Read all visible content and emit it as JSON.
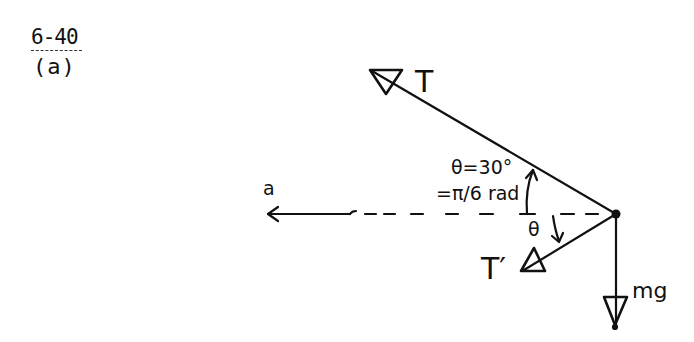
{
  "problem": {
    "number": "6-40",
    "part": "(a)"
  },
  "diagram": {
    "type": "free-body diagram",
    "body_point": {
      "x": 616,
      "y": 214
    },
    "forces": [
      {
        "label": "T",
        "direction": "up-left",
        "angle_from_horizontal": "30°"
      },
      {
        "label": "T′",
        "direction": "down-left",
        "angle_from_horizontal": "θ"
      },
      {
        "label": "mg",
        "direction": "down"
      }
    ],
    "acceleration": {
      "label": "a",
      "direction": "left"
    },
    "angle_annotation": {
      "line1": "θ=30°",
      "line2": "=π/6 rad"
    },
    "lower_angle_label": "θ",
    "colors": {
      "ink": "#111111",
      "background": "#ffffff"
    }
  },
  "labels": {
    "T": "T",
    "T_prime": "T′",
    "a": "a",
    "mg": "mg",
    "theta_eq": "θ=30°",
    "rad_eq": "=π/6 rad",
    "theta_lower": "θ"
  }
}
